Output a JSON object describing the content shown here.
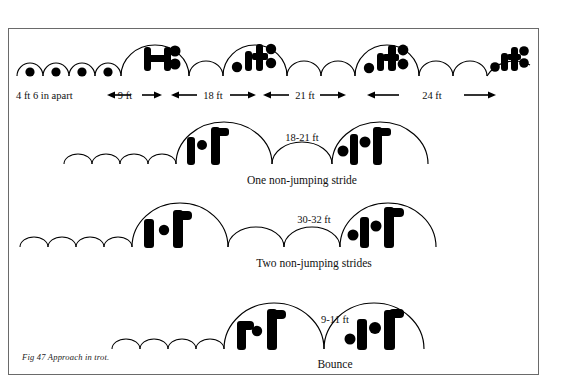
{
  "figure": {
    "caption": "Fig 47  Approach in trot.",
    "title_hidden": "Approach in trot"
  },
  "row1": {
    "name": "approach-in-trot-top-row",
    "pole_label": "4 ft 6 in apart",
    "dimensions": [
      {
        "label": "9 ft"
      },
      {
        "label": "18 ft"
      },
      {
        "label": "21 ft"
      },
      {
        "label": "24 ft"
      }
    ],
    "trotting_poles_count": 4,
    "fences_count": 4
  },
  "row2": {
    "name": "one-non-jumping-stride-row",
    "distance": "18-21 ft",
    "stride_label": "One non-jumping stride",
    "trotting_poles_count": 4,
    "fences_count": 2,
    "non_jumping_arcs": 1
  },
  "row3": {
    "name": "two-non-jumping-strides-row",
    "distance": "30-32 ft",
    "stride_label": "Two non-jumping strides",
    "trotting_poles_count": 4,
    "fences_count": 2,
    "non_jumping_arcs": 2
  },
  "row4": {
    "name": "bounce-row",
    "distance": "9-11 ft",
    "stride_label": "Bounce",
    "trotting_poles_count": 3,
    "fences_count": 2,
    "non_jumping_arcs": 0
  },
  "colors": {
    "ink": "#000000",
    "frame": "#6a6a6a",
    "paper": "#ffffff"
  }
}
